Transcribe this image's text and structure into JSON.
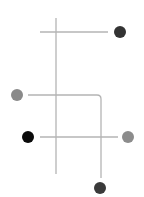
{
  "diagram": {
    "background": "#ffffff",
    "line_color": "#b4b4b4",
    "lines": [
      {
        "id": "vertical-axis",
        "x1": 56,
        "y1": 18,
        "x2": 56,
        "y2": 174
      },
      {
        "id": "top-horizontal",
        "x1": 40,
        "y1": 32,
        "x2": 108,
        "y2": 32
      },
      {
        "id": "bottom-horizontal",
        "x1": 40,
        "y1": 137,
        "x2": 118,
        "y2": 137
      }
    ],
    "elbow": {
      "id": "elbow-path",
      "d": "M28 95 L97 95 Q101 95 101 99 L101 178"
    },
    "nodes": [
      {
        "id": "node-top-right",
        "cx": 120,
        "cy": 32,
        "r": 6,
        "color": "#333333"
      },
      {
        "id": "node-mid-left",
        "cx": 17,
        "cy": 95,
        "r": 6,
        "color": "#8a8a8a"
      },
      {
        "id": "node-lower-left",
        "cx": 28,
        "cy": 137,
        "r": 6,
        "color": "#0a0a0a"
      },
      {
        "id": "node-lower-right",
        "cx": 128,
        "cy": 137,
        "r": 6,
        "color": "#8c8c8c"
      },
      {
        "id": "node-bottom",
        "cx": 100,
        "cy": 188,
        "r": 6,
        "color": "#3a3a3a"
      }
    ]
  }
}
